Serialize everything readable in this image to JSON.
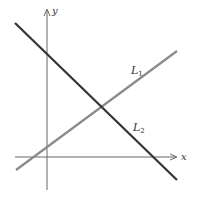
{
  "diagram": {
    "type": "coordinate-plane-two-lines",
    "axes": {
      "x_label": "x",
      "y_label": "y",
      "color": "#666666"
    },
    "lines": [
      {
        "id": "L1",
        "label_main": "L",
        "label_sub": "1",
        "slope_sign": "positive",
        "color": "#8a8a8a",
        "from": [
          16,
          170
        ],
        "to": [
          177,
          51
        ]
      },
      {
        "id": "L2",
        "label_main": "L",
        "label_sub": "2",
        "slope_sign": "negative",
        "color": "#333333",
        "from": [
          15,
          23
        ],
        "to": [
          177,
          180
        ]
      }
    ],
    "intersection": [
      102,
      106
    ]
  }
}
